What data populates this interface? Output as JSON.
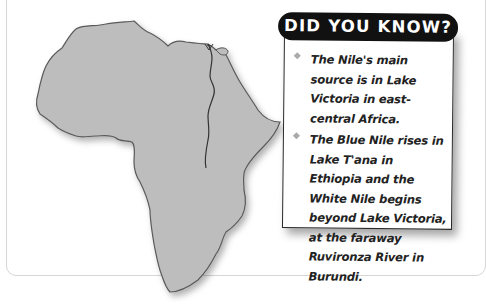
{
  "map": {
    "subject": "Africa outline with Nile River",
    "land_color": "#bdbdbd",
    "outline_color": "#555555",
    "river_color": "#333333"
  },
  "fact_box": {
    "title": "DID YOU KNOW?",
    "facts": [
      "The Nile's main source is in Lake Victoria in east-central Africa.",
      "The Blue Nile rises in Lake T'ana in Ethiopia and the White Nile begins beyond Lake Victoria, at the faraway Ruvironza River in Burundi."
    ]
  }
}
